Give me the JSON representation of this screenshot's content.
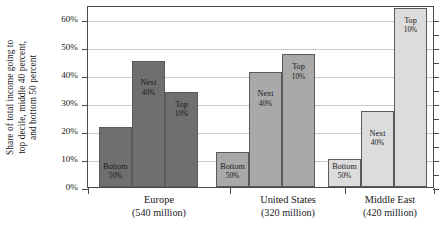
{
  "chart_data": {
    "type": "bar",
    "title": "",
    "subtitle": "",
    "xlabel": "",
    "ylabel_lines": [
      "Share of total income going to",
      "top decile, middle 40 percent,",
      "and bottom 50 percent"
    ],
    "ylim": [
      0,
      65
    ],
    "ytick_values": [
      0,
      10,
      20,
      30,
      40,
      50,
      60
    ],
    "ytick_labels": [
      "0%",
      "10%",
      "20%",
      "30%",
      "40%",
      "50%",
      "60%"
    ],
    "grid": true,
    "legend": "none",
    "categories": [
      "Europe",
      "United States",
      "Middle East"
    ],
    "category_sublabels": [
      "(540 million)",
      "(320 million)",
      "(420 million)"
    ],
    "series": [
      {
        "name": "Bottom 50%",
        "label_line1": "Bottom",
        "label_line2": "50%",
        "color": "#6f6f6f",
        "values": [
          21.5,
          12.5,
          10.0
        ]
      },
      {
        "name": "Next 40%",
        "label_line1": "Next",
        "label_line2": "40%",
        "color": "#6f6f6f",
        "values": [
          45.0,
          41.0,
          27.0
        ]
      },
      {
        "name": "Top 10%",
        "label_line1": "Top",
        "label_line2": "10%",
        "color": "#6f6f6f",
        "values": [
          34.0,
          47.5,
          64.0
        ]
      }
    ],
    "group_colors": [
      "#6f6f6f",
      "#a9a9a9",
      "#dcdcdc"
    ],
    "annotations": []
  }
}
